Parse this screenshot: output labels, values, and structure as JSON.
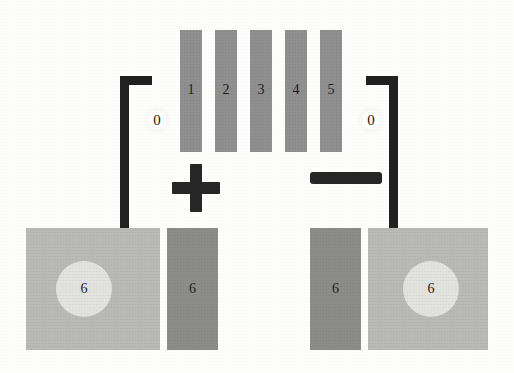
{
  "figure": {
    "background_color": "#fdfdfc"
  },
  "colors": {
    "bar_gray": "#8f8f8f",
    "wire_black": "#212121",
    "glyph_black": "#262626",
    "block_light": "#b9b9b7",
    "block_dark": "#8c8c8a",
    "disc_light": "#e2e2de",
    "text_dark": "#1c1c1c"
  },
  "center_bars": {
    "label": "numbered vertical element stack",
    "items": [
      {
        "id": "bar-1",
        "label": "1",
        "x": 180,
        "y": 30,
        "w": 22,
        "h": 122
      },
      {
        "id": "bar-2",
        "label": "2",
        "x": 215,
        "y": 30,
        "w": 22,
        "h": 122
      },
      {
        "id": "bar-3",
        "label": "3",
        "x": 250,
        "y": 30,
        "w": 22,
        "h": 122
      },
      {
        "id": "bar-4",
        "label": "4",
        "x": 285,
        "y": 30,
        "w": 22,
        "h": 122
      },
      {
        "id": "bar-5",
        "label": "5",
        "x": 320,
        "y": 30,
        "w": 22,
        "h": 122
      }
    ]
  },
  "terminals": {
    "left": {
      "label": "0",
      "x": 142,
      "y": 105,
      "size": 30
    },
    "right": {
      "label": "0",
      "x": 356,
      "y": 105,
      "size": 30
    }
  },
  "polarity": {
    "plus": {
      "label": "+",
      "cx": 196,
      "cy": 188
    },
    "minus": {
      "label": "−",
      "x": 310,
      "y": 172,
      "w": 72,
      "h": 12
    }
  },
  "wires": {
    "left": {
      "name": "left-conductor",
      "vertical": {
        "x": 120,
        "y": 76,
        "w": 9,
        "h": 158
      },
      "horizontal": {
        "x": 120,
        "y": 76,
        "w": 32,
        "h": 9
      }
    },
    "right": {
      "name": "right-conductor",
      "vertical": {
        "x": 389,
        "y": 76,
        "w": 9,
        "h": 158
      },
      "horizontal": {
        "x": 366,
        "y": 76,
        "w": 32,
        "h": 9
      }
    }
  },
  "blocks": [
    {
      "id": "block-left-light",
      "kind": "light",
      "label": "6",
      "x": 26,
      "y": 228,
      "w": 134,
      "h": 122,
      "disc": {
        "d": 56
      }
    },
    {
      "id": "block-left-dark",
      "kind": "dark",
      "label": "6",
      "x": 167,
      "y": 228,
      "w": 51,
      "h": 122
    },
    {
      "id": "block-right-dark",
      "kind": "dark",
      "label": "6",
      "x": 310,
      "y": 228,
      "w": 51,
      "h": 122
    },
    {
      "id": "block-right-light",
      "kind": "light",
      "label": "6",
      "x": 368,
      "y": 228,
      "w": 120,
      "h": 122,
      "disc": {
        "d": 56
      }
    }
  ]
}
